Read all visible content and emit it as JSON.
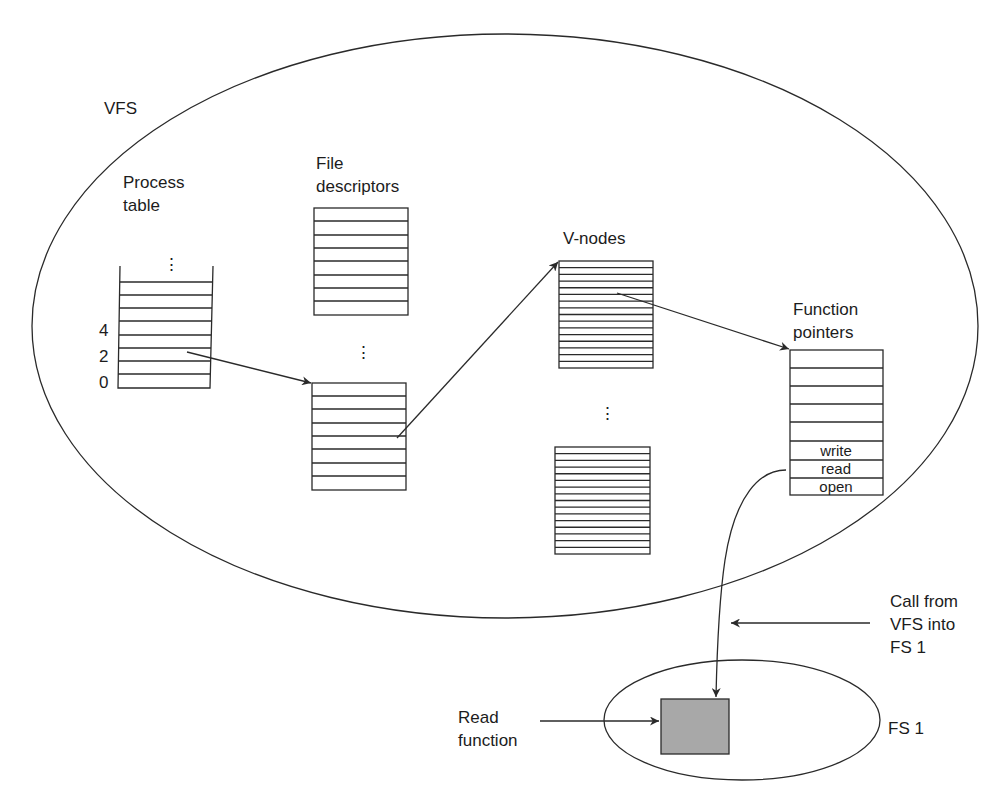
{
  "diagram": {
    "vfs": {
      "label": "VFS"
    },
    "process_table": {
      "title_line1": "Process",
      "title_line2": "table",
      "dots": "⋮",
      "row_labels": [
        "4",
        "2",
        "0"
      ]
    },
    "file_descriptors": {
      "title_line1": "File",
      "title_line2": "descriptors",
      "dots": "⋮"
    },
    "v_nodes": {
      "title": "V-nodes",
      "dots": "⋮"
    },
    "function_pointers": {
      "title_line1": "Function",
      "title_line2": "pointers",
      "cells": [
        "write",
        "read",
        "open"
      ]
    },
    "call_annotation": {
      "line1": "Call from",
      "line2": "VFS into",
      "line3": "FS 1"
    },
    "fs1": {
      "label": "FS 1"
    },
    "read_function": {
      "line1": "Read",
      "line2": "function"
    },
    "colors": {
      "ink": "#2a2a2a",
      "read_function_fill": "#a8a8a8",
      "background": "#ffffff"
    }
  }
}
